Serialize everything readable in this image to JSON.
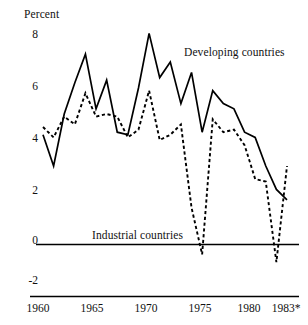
{
  "chart_data": {
    "type": "line",
    "title": "",
    "subtitle": "",
    "ylabel": "Percent",
    "xlabel": "",
    "xlim": [
      1960,
      1983
    ],
    "ylim": [
      -2,
      8
    ],
    "grid": false,
    "legend_position": "inline-annotations",
    "yticks": [
      "8",
      "6",
      "4",
      "2",
      "0",
      "-2"
    ],
    "ytick_values": [
      8,
      6,
      4,
      2,
      0,
      -2
    ],
    "xticks": [
      "1960",
      "1965",
      "1970",
      "1975",
      "1980",
      "1983*"
    ],
    "xtick_values": [
      1960,
      1965,
      1970,
      1975,
      1980,
      1983
    ],
    "x": [
      1960,
      1961,
      1962,
      1963,
      1964,
      1965,
      1966,
      1967,
      1968,
      1969,
      1970,
      1971,
      1972,
      1973,
      1974,
      1975,
      1976,
      1977,
      1978,
      1979,
      1980,
      1981,
      1982,
      1983
    ],
    "series": [
      {
        "name": "Developing countries",
        "style": "solid",
        "color": "#000000",
        "values": [
          4.2,
          3.0,
          5.0,
          6.2,
          7.3,
          5.2,
          6.3,
          4.3,
          4.2,
          6.0,
          8.1,
          6.4,
          7.0,
          5.4,
          6.6,
          4.3,
          5.9,
          5.4,
          5.2,
          4.3,
          4.1,
          3.0,
          2.1,
          1.7
        ]
      },
      {
        "name": "Industrial countries",
        "style": "dashed",
        "color": "#000000",
        "values": [
          4.5,
          4.1,
          4.9,
          4.6,
          5.8,
          4.9,
          5.0,
          4.9,
          4.1,
          4.4,
          5.9,
          4.0,
          4.2,
          4.6,
          1.4,
          -0.4,
          4.8,
          4.3,
          4.4,
          3.8,
          2.5,
          2.4,
          -0.7,
          3.0
        ]
      }
    ],
    "annotations": [
      {
        "text": "Developing countries",
        "x": 1975.5,
        "y": 6.9
      },
      {
        "text": "Industrial countries",
        "x": 1968.0,
        "y": 0.35
      }
    ],
    "footnote_marker": "*"
  }
}
